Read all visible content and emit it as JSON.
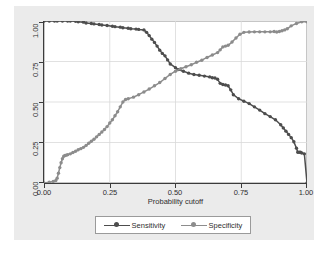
{
  "chart_data": {
    "type": "line",
    "title": "",
    "xlabel": "Probability cutoff",
    "ylabel": "Sensitivity/Specificity",
    "xlim": [
      0.0,
      1.0
    ],
    "ylim": [
      0.0,
      1.0
    ],
    "xticks": [
      "0.00",
      "0.25",
      "0.50",
      "0.75",
      "1.00"
    ],
    "xtick_values": [
      0.0,
      0.25,
      0.5,
      0.75,
      1.0
    ],
    "yticks": [
      "0.00",
      "0.25",
      "0.50",
      "0.75",
      "1.00"
    ],
    "ytick_values": [
      0.0,
      0.25,
      0.5,
      0.75,
      1.0
    ],
    "grid": true,
    "legend_position": "bottom",
    "marker": "circle",
    "series": [
      {
        "name": "Sensitivity",
        "color": "#4d4d4d",
        "x": [
          0.0,
          0.02,
          0.04,
          0.05,
          0.07,
          0.09,
          0.1,
          0.12,
          0.13,
          0.15,
          0.16,
          0.18,
          0.19,
          0.21,
          0.22,
          0.24,
          0.26,
          0.27,
          0.29,
          0.3,
          0.32,
          0.33,
          0.35,
          0.36,
          0.38,
          0.39,
          0.4,
          0.41,
          0.42,
          0.43,
          0.44,
          0.45,
          0.46,
          0.47,
          0.48,
          0.5,
          0.51,
          0.53,
          0.55,
          0.57,
          0.59,
          0.61,
          0.63,
          0.64,
          0.65,
          0.66,
          0.67,
          0.68,
          0.69,
          0.7,
          0.71,
          0.72,
          0.74,
          0.76,
          0.78,
          0.8,
          0.82,
          0.84,
          0.86,
          0.88,
          0.9,
          0.91,
          0.92,
          0.93,
          0.94,
          0.95,
          0.96,
          0.965,
          0.97,
          0.975,
          0.98,
          0.99,
          1.0
        ],
        "y": [
          1.0,
          1.0,
          1.0,
          1.0,
          1.0,
          1.0,
          1.0,
          0.998,
          0.995,
          0.993,
          0.988,
          0.985,
          0.982,
          0.978,
          0.975,
          0.972,
          0.968,
          0.965,
          0.962,
          0.958,
          0.955,
          0.952,
          0.95,
          0.948,
          0.945,
          0.93,
          0.91,
          0.888,
          0.868,
          0.845,
          0.82,
          0.8,
          0.785,
          0.76,
          0.735,
          0.712,
          0.7,
          0.69,
          0.678,
          0.67,
          0.665,
          0.66,
          0.655,
          0.65,
          0.648,
          0.64,
          0.615,
          0.608,
          0.605,
          0.6,
          0.575,
          0.545,
          0.52,
          0.505,
          0.49,
          0.47,
          0.45,
          0.428,
          0.41,
          0.39,
          0.36,
          0.34,
          0.32,
          0.3,
          0.28,
          0.255,
          0.215,
          0.19,
          0.19,
          0.19,
          0.185,
          0.18,
          0.0
        ]
      },
      {
        "name": "Specificity",
        "color": "#8c8c8c",
        "x": [
          0.0,
          0.02,
          0.035,
          0.045,
          0.05,
          0.055,
          0.06,
          0.065,
          0.07,
          0.075,
          0.08,
          0.085,
          0.09,
          0.1,
          0.11,
          0.12,
          0.13,
          0.14,
          0.15,
          0.16,
          0.17,
          0.18,
          0.19,
          0.2,
          0.21,
          0.22,
          0.23,
          0.24,
          0.25,
          0.26,
          0.27,
          0.28,
          0.29,
          0.3,
          0.31,
          0.32,
          0.34,
          0.36,
          0.38,
          0.4,
          0.42,
          0.44,
          0.46,
          0.48,
          0.5,
          0.52,
          0.54,
          0.56,
          0.58,
          0.6,
          0.62,
          0.64,
          0.66,
          0.67,
          0.68,
          0.69,
          0.7,
          0.715,
          0.73,
          0.745,
          0.76,
          0.78,
          0.8,
          0.82,
          0.84,
          0.86,
          0.875,
          0.885,
          0.895,
          0.905,
          0.915,
          0.925,
          0.94,
          0.96,
          0.98,
          1.0
        ],
        "y": [
          0.0,
          0.005,
          0.01,
          0.015,
          0.03,
          0.06,
          0.095,
          0.125,
          0.15,
          0.165,
          0.17,
          0.172,
          0.175,
          0.18,
          0.188,
          0.196,
          0.205,
          0.212,
          0.22,
          0.232,
          0.245,
          0.258,
          0.27,
          0.285,
          0.3,
          0.315,
          0.33,
          0.348,
          0.37,
          0.39,
          0.415,
          0.44,
          0.47,
          0.5,
          0.515,
          0.52,
          0.53,
          0.545,
          0.562,
          0.58,
          0.6,
          0.62,
          0.645,
          0.67,
          0.69,
          0.705,
          0.718,
          0.73,
          0.745,
          0.758,
          0.775,
          0.79,
          0.805,
          0.822,
          0.84,
          0.845,
          0.85,
          0.87,
          0.895,
          0.918,
          0.93,
          0.932,
          0.933,
          0.933,
          0.933,
          0.933,
          0.935,
          0.932,
          0.935,
          0.94,
          0.945,
          0.952,
          0.97,
          0.985,
          0.995,
          0.995
        ]
      }
    ]
  },
  "legend": {
    "entries": [
      {
        "label": "Sensitivity"
      },
      {
        "label": "Specificity"
      }
    ]
  }
}
